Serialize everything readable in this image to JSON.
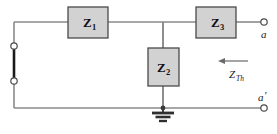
{
  "diagram": {
    "colors": {
      "wire": "#8a8a8a",
      "wire_dark": "#6f6f6f",
      "box_fill": "#d2d2d2",
      "box_stroke": "#4a4a4a",
      "terminal_stroke": "#4a4a4a",
      "terminal_fill": "#ffffff",
      "ground": "#3a3a3a",
      "source_segment": "#1a1a1a",
      "text": "#111111",
      "background": "#ffffff"
    },
    "impedances": [
      {
        "name": "impedance-z1",
        "symbol": "Z",
        "subscript": "1",
        "orientation": "horizontal",
        "x": 68,
        "y": 7,
        "width": 40,
        "height": 31
      },
      {
        "name": "impedance-z2",
        "symbol": "Z",
        "subscript": "2",
        "orientation": "vertical",
        "x": 148,
        "y": 48,
        "width": 31,
        "height": 38
      },
      {
        "name": "impedance-z3",
        "symbol": "Z",
        "subscript": "3",
        "orientation": "horizontal",
        "x": 196,
        "y": 7,
        "width": 40,
        "height": 31
      }
    ],
    "terminals": [
      {
        "name": "terminal-a",
        "label": "a",
        "prime": "",
        "cx": 264,
        "cy": 22,
        "r": 3.2,
        "label_x": 262,
        "label_y": 37
      },
      {
        "name": "terminal-a-prime",
        "label": "a",
        "prime": "′",
        "cx": 264,
        "cy": 108,
        "r": 3.2,
        "label_x": 259,
        "label_y": 101
      },
      {
        "name": "terminal-source-top",
        "label": "",
        "prime": "",
        "cx": 14,
        "cy": 46,
        "r": 3.2,
        "label_x": 0,
        "label_y": 0
      },
      {
        "name": "terminal-source-bottom",
        "label": "",
        "prime": "",
        "cx": 14,
        "cy": 81,
        "r": 3.2,
        "label_x": 0,
        "label_y": 0
      }
    ],
    "annotation": {
      "name": "thevenin-impedance-annotation",
      "symbol": "Z",
      "subscript": "Th",
      "arrow_direction": "left",
      "arrow_x_start": 248,
      "arrow_x_end": 219,
      "arrow_y": 61,
      "label_x": 234,
      "label_y": 77
    },
    "ground": {
      "name": "ground-symbol",
      "x": 163,
      "y": 110,
      "bars": [
        {
          "half_width": 11,
          "dy": 3,
          "thickness": 2.6
        },
        {
          "half_width": 7.5,
          "dy": 7,
          "thickness": 2.4
        },
        {
          "half_width": 4,
          "dy": 11,
          "thickness": 2.2
        }
      ]
    },
    "nodes": [
      {
        "name": "junction-top-z2",
        "cx": 163,
        "cy": 22,
        "r": 0
      },
      {
        "name": "junction-ground-node",
        "cx": 163,
        "cy": 108,
        "r": 2.4
      }
    ],
    "rails": {
      "top_y": 22,
      "bottom_y": 108,
      "left_x": 14,
      "right_x": 264,
      "branch_x": 163
    }
  }
}
